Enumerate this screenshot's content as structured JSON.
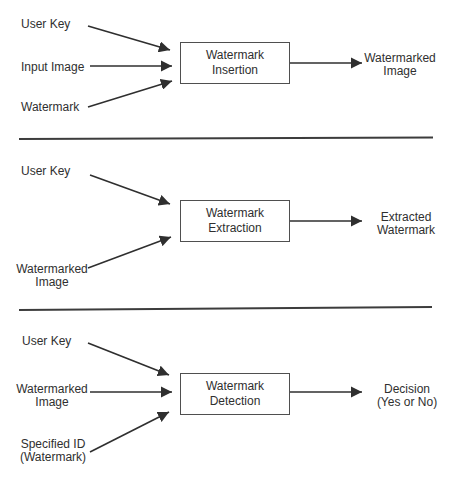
{
  "colors": {
    "ink": "#2f2f2f",
    "box_border": "#4f4f4f",
    "divider": "#3c3c3c",
    "background": "#ffffff"
  },
  "sections": [
    {
      "id": "watermark-insertion",
      "inputs": [
        {
          "lines": [
            "User Key"
          ]
        },
        {
          "lines": [
            "Input Image"
          ]
        },
        {
          "lines": [
            "Watermark"
          ]
        }
      ],
      "process": {
        "lines": [
          "Watermark",
          "Insertion"
        ]
      },
      "output": {
        "lines": [
          "Watermarked",
          "Image"
        ]
      }
    },
    {
      "id": "watermark-extraction",
      "inputs": [
        {
          "lines": [
            "User Key"
          ]
        },
        {
          "lines": [
            "Watermarked",
            "Image"
          ]
        }
      ],
      "process": {
        "lines": [
          "Watermark",
          "Extraction"
        ]
      },
      "output": {
        "lines": [
          "Extracted",
          "Watermark"
        ]
      }
    },
    {
      "id": "watermark-detection",
      "inputs": [
        {
          "lines": [
            "User Key"
          ]
        },
        {
          "lines": [
            "Watermarked",
            "Image"
          ]
        },
        {
          "lines": [
            "Specified ID",
            "(Watermark)"
          ]
        }
      ],
      "process": {
        "lines": [
          "Watermark",
          "Detection"
        ]
      },
      "output": {
        "lines": [
          "Decision",
          "(Yes or No)"
        ]
      }
    }
  ]
}
